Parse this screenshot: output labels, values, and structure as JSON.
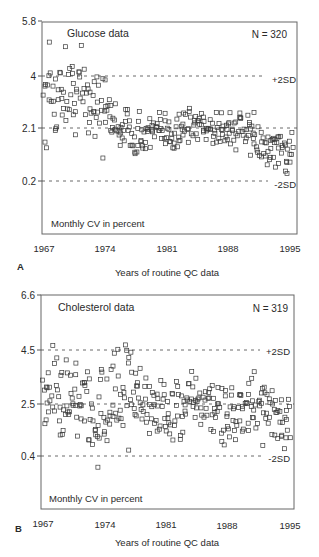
{
  "chart_data": [
    {
      "panel": "A",
      "type": "scatter",
      "title": "Glucose data",
      "annotation_n": "N = 320",
      "ylabel": "Monthly CV in percent",
      "xlabel": "Years of routine QC data",
      "x_ticks": [
        "1967",
        "1974",
        "1981",
        "1988",
        "1995"
      ],
      "y_ticks": [
        "5.8",
        "4",
        "2.1",
        "0.2"
      ],
      "xlim": [
        1967,
        1995
      ],
      "ylim": [
        -1.1,
        5.8
      ],
      "grid": false,
      "reference_lines": [
        {
          "label": "+2SD",
          "value": 4.0
        },
        {
          "label": "",
          "value": 2.1
        },
        {
          "label": "-2SD",
          "value": 0.2
        }
      ],
      "frame": {
        "left": 42,
        "right": 297,
        "top": 22,
        "bottom": 234,
        "ytick_px": [
          21,
          76,
          128,
          181
        ]
      },
      "series": [
        {
          "name": "Monthly CV",
          "marker": "open-square",
          "trend": [
            [
              1967,
              2.6
            ],
            [
              1969,
              3.4
            ],
            [
              1971,
              3.3
            ],
            [
              1973,
              3.0
            ],
            [
              1975,
              2.2
            ],
            [
              1978,
              1.8
            ],
            [
              1981,
              1.9
            ],
            [
              1984,
              2.2
            ],
            [
              1987,
              2.1
            ],
            [
              1990,
              1.9
            ],
            [
              1992,
              1.3
            ],
            [
              1995,
              1.2
            ]
          ],
          "count": 320
        }
      ]
    },
    {
      "panel": "B",
      "type": "scatter",
      "title": "Cholesterol data",
      "annotation_n": "N = 319",
      "ylabel": "Monthly CV in percent",
      "xlabel": "Years of routine QC data",
      "x_ticks": [
        "1967",
        "1974",
        "1981",
        "1988",
        "1995"
      ],
      "y_ticks": [
        "6.6",
        "4.5",
        "2.5",
        "0.4"
      ],
      "xlim": [
        1967,
        1995
      ],
      "ylim": [
        -1.3,
        6.6
      ],
      "grid": false,
      "reference_lines": [
        {
          "label": "+2SD",
          "value": 4.5
        },
        {
          "label": "",
          "value": 2.5
        },
        {
          "label": "-2SD",
          "value": 0.4
        }
      ],
      "frame": {
        "left": 41,
        "right": 294,
        "top": 295,
        "bottom": 509,
        "ytick_px": [
          295,
          350,
          404,
          456
        ]
      },
      "series": [
        {
          "name": "Monthly CV",
          "marker": "open-square",
          "trend": [
            [
              1967,
              3.2
            ],
            [
              1970,
              3.0
            ],
            [
              1972,
              2.3
            ],
            [
              1974,
              2.6
            ],
            [
              1976,
              3.2
            ],
            [
              1978,
              2.5
            ],
            [
              1981,
              2.0
            ],
            [
              1984,
              2.4
            ],
            [
              1987,
              2.2
            ],
            [
              1989,
              1.9
            ],
            [
              1991,
              2.3
            ],
            [
              1995,
              1.8
            ]
          ],
          "count": 319
        }
      ]
    }
  ],
  "panels": {
    "a": {
      "letter": "A",
      "title": "Glucose data",
      "n": "N = 320",
      "ylabel": "Monthly CV in percent",
      "xlabel": "Years of routine QC data",
      "plus": "+2SD",
      "minus": "-2SD",
      "yt": [
        "5.8",
        "4",
        "2.1",
        "0.2"
      ],
      "xt": [
        "1967",
        "1974",
        "1981",
        "1988",
        "1995"
      ]
    },
    "b": {
      "letter": "B",
      "title": "Cholesterol data",
      "n": "N = 319",
      "ylabel": "Monthly CV in percent",
      "xlabel": "Years of routine QC data",
      "plus": "+2SD",
      "minus": "-2SD",
      "yt": [
        "6.6",
        "4.5",
        "2.5",
        "0.4"
      ],
      "xt": [
        "1967",
        "1974",
        "1981",
        "1988",
        "1995"
      ]
    }
  },
  "colors": {
    "axis": "#555555",
    "marker": "#3a3a3a",
    "text": "#2a2a2a"
  }
}
